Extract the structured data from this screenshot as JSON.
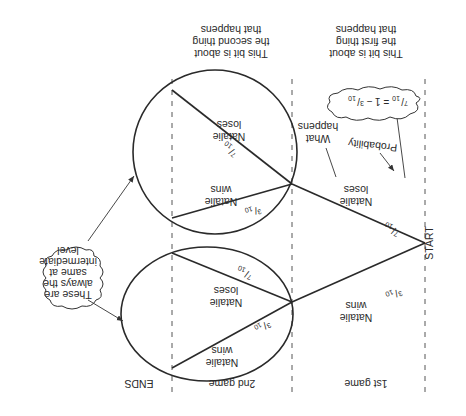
{
  "orientation": "rotated 180 degrees",
  "headers": {
    "first_col": [
      "This bit is about",
      "the first thing",
      "that happens"
    ],
    "second_col": [
      "This bit is about",
      "the second thing",
      "that happens"
    ]
  },
  "footers": {
    "start": "START",
    "game1": "1st game",
    "game2": "2nd game",
    "ends": "ENDS"
  },
  "branches": {
    "first_win": {
      "label": [
        "Natalie",
        "wins"
      ],
      "prob_num": "3",
      "prob_den": "10"
    },
    "first_lose": {
      "label": [
        "Natalie",
        "loses"
      ],
      "prob_num": "7",
      "prob_den": "10"
    },
    "second_after_win_win": {
      "label": [
        "Natalie",
        "wins"
      ],
      "prob_num": "3",
      "prob_den": "10"
    },
    "second_after_win_lose": {
      "label": [
        "Natalie",
        "loses"
      ],
      "prob_num": "7",
      "prob_den": "10"
    },
    "second_after_lose_win": {
      "label": [
        "Natalie",
        "wins"
      ],
      "prob_num": "3",
      "prob_den": "10"
    },
    "second_after_lose_lose": {
      "label": [
        "Natalie",
        "loses"
      ],
      "prob_num": "7",
      "prob_den": "10"
    }
  },
  "annotations": {
    "what_happens": [
      "What",
      "happens"
    ],
    "probability": "Probability",
    "formula_cloud": {
      "lhs_num": "7",
      "lhs_den": "10",
      "middle": " = 1 − ",
      "rhs_num": "3",
      "rhs_den": "10"
    },
    "same_cloud": [
      "These are",
      "always the",
      "same at",
      "intermediate",
      "level"
    ]
  }
}
